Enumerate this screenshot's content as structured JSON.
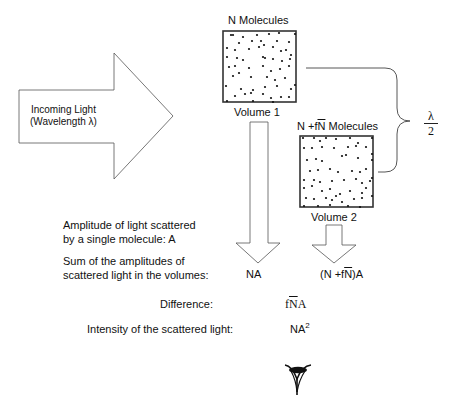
{
  "incoming_light": {
    "line1": "Incoming Light",
    "line2": "(Wavelength λ)"
  },
  "volume1": {
    "title": "N Molecules",
    "label": "Volume 1",
    "sum": "NA"
  },
  "volume2": {
    "title_prefix": "N +f",
    "title_overline": "N",
    "title_suffix": " Molecules",
    "label": "Volume 2",
    "sum_prefix": "(N +f",
    "sum_overline": "N",
    "sum_suffix": ")A"
  },
  "separation": {
    "numerator": "λ",
    "denominator": "2"
  },
  "labels": {
    "amplitude_line1": "Amplitude of light scattered",
    "amplitude_line2": "by a single molecule: A",
    "sum_line1": "Sum of the amplitudes of",
    "sum_line2": "scattered light in the volumes:",
    "difference": "Difference:",
    "intensity": "Intensity of the scattered light:"
  },
  "values": {
    "difference_prefix": "f",
    "difference_overline": "N",
    "difference_suffix": "A",
    "intensity_base": "NA",
    "intensity_exp": "2"
  },
  "icons": {
    "observer": "eye-icon"
  },
  "dots": {
    "box1": [
      [
        8,
        4
      ],
      [
        10,
        4
      ],
      [
        20,
        6
      ],
      [
        34,
        4
      ],
      [
        46,
        3
      ],
      [
        56,
        2
      ],
      [
        72,
        3
      ],
      [
        16,
        12
      ],
      [
        29,
        10
      ],
      [
        38,
        10
      ],
      [
        54,
        10
      ],
      [
        66,
        11
      ],
      [
        4,
        17
      ],
      [
        12,
        19
      ],
      [
        26,
        18
      ],
      [
        36,
        16
      ],
      [
        41,
        14
      ],
      [
        50,
        16
      ],
      [
        58,
        20
      ],
      [
        63,
        19
      ],
      [
        68,
        24
      ],
      [
        4,
        26
      ],
      [
        14,
        27
      ],
      [
        20,
        29
      ],
      [
        40,
        26
      ],
      [
        42,
        27
      ],
      [
        50,
        28
      ],
      [
        59,
        30
      ],
      [
        67,
        28
      ],
      [
        6,
        36
      ],
      [
        12,
        35
      ],
      [
        16,
        42
      ],
      [
        26,
        37
      ],
      [
        40,
        35
      ],
      [
        48,
        40
      ],
      [
        57,
        38
      ],
      [
        66,
        35
      ],
      [
        10,
        45
      ],
      [
        28,
        46
      ],
      [
        44,
        46
      ],
      [
        52,
        49
      ],
      [
        62,
        47
      ],
      [
        3,
        55
      ],
      [
        18,
        58
      ],
      [
        30,
        59
      ],
      [
        42,
        56
      ],
      [
        54,
        55
      ],
      [
        68,
        58
      ],
      [
        72,
        54
      ],
      [
        12,
        65
      ],
      [
        22,
        63
      ],
      [
        28,
        62
      ],
      [
        40,
        63
      ],
      [
        48,
        67
      ],
      [
        58,
        66
      ],
      [
        66,
        66
      ],
      [
        4,
        70
      ],
      [
        30,
        70
      ],
      [
        50,
        71
      ]
    ],
    "box2": [
      [
        3,
        2
      ],
      [
        14,
        2
      ],
      [
        20,
        5
      ],
      [
        26,
        2
      ],
      [
        36,
        3
      ],
      [
        50,
        2
      ],
      [
        58,
        7
      ],
      [
        72,
        2
      ],
      [
        4,
        12
      ],
      [
        12,
        12
      ],
      [
        22,
        11
      ],
      [
        34,
        12
      ],
      [
        48,
        11
      ],
      [
        56,
        10
      ],
      [
        66,
        11
      ],
      [
        72,
        18
      ],
      [
        7,
        24
      ],
      [
        16,
        23
      ],
      [
        22,
        25
      ],
      [
        42,
        20
      ],
      [
        46,
        19
      ],
      [
        58,
        22
      ],
      [
        72,
        24
      ],
      [
        10,
        35
      ],
      [
        18,
        34
      ],
      [
        30,
        33
      ],
      [
        38,
        36
      ],
      [
        52,
        35
      ],
      [
        60,
        36
      ],
      [
        66,
        33
      ],
      [
        72,
        42
      ],
      [
        4,
        44
      ],
      [
        14,
        44
      ],
      [
        20,
        46
      ],
      [
        32,
        45
      ],
      [
        44,
        44
      ],
      [
        56,
        43
      ],
      [
        62,
        47
      ],
      [
        70,
        45
      ],
      [
        4,
        52
      ],
      [
        12,
        50
      ],
      [
        22,
        55
      ],
      [
        30,
        53
      ],
      [
        40,
        58
      ],
      [
        50,
        55
      ],
      [
        62,
        57
      ],
      [
        66,
        52
      ],
      [
        6,
        62
      ],
      [
        14,
        63
      ],
      [
        26,
        62
      ],
      [
        32,
        64
      ],
      [
        36,
        60
      ],
      [
        42,
        66
      ],
      [
        54,
        63
      ],
      [
        62,
        62
      ],
      [
        72,
        60
      ],
      [
        4,
        70
      ],
      [
        18,
        70
      ],
      [
        30,
        69
      ],
      [
        48,
        70
      ],
      [
        60,
        71
      ]
    ]
  }
}
